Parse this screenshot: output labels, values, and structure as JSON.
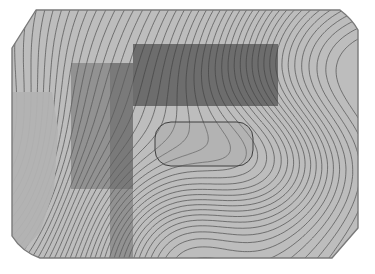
{
  "figure": {
    "title": "",
    "background_color": "#ffffff",
    "width": 375,
    "height": 274
  },
  "domain_outline": {
    "name": "simulation-domain-boundary",
    "stroke_color": "#7a7a7a",
    "description": "irregular polygon with chamfered top-left corner, rounded bottom-left corner, small rounded top-right corner and chamfered bottom-right corner",
    "vertices": [
      [
        36,
        10
      ],
      [
        340,
        10
      ],
      [
        352,
        19
      ],
      [
        358,
        30
      ],
      [
        358,
        228
      ],
      [
        332,
        258
      ],
      [
        40,
        258
      ],
      [
        22,
        252
      ],
      [
        12,
        236
      ],
      [
        12,
        48
      ]
    ]
  },
  "contour_field": {
    "name": "contour-line-field",
    "type": "contour",
    "line_color": "#4e4e4e",
    "line_width": 0.7,
    "fill_light": "#bdbdbd",
    "fill_mid": "#aaaaaa",
    "fill_plateau": "#b5b5b5",
    "n_levels": 46,
    "description": "dense greyscale contour lines sweeping from upper-left to lower-right with a saddle near the centre-right and a flat plateau region along the left edge"
  },
  "overlays": [
    {
      "id": "region-a",
      "name": "overlay-rect-dark-top",
      "shape": "rectangle",
      "x": 133,
      "y": 44,
      "width": 145,
      "height": 62,
      "fill": "#3c3c3c",
      "opacity": 0.62,
      "label": ""
    },
    {
      "id": "region-b",
      "name": "overlay-rect-mid-left",
      "shape": "rectangle",
      "x": 71,
      "y": 63,
      "width": 62,
      "height": 126,
      "fill": "#5e5e5e",
      "opacity": 0.45,
      "label": ""
    },
    {
      "id": "region-c",
      "name": "overlay-band-vertical",
      "shape": "rectangle",
      "x": 110,
      "y": 63,
      "width": 23,
      "height": 195,
      "fill": "#5e5e5e",
      "opacity": 0.45,
      "label": ""
    },
    {
      "id": "region-d",
      "name": "overlay-rounded-rect-center",
      "shape": "rounded-rectangle",
      "x": 155,
      "y": 122,
      "width": 98,
      "height": 44,
      "corner_radius": 16,
      "fill": "#9a9a9a",
      "opacity": 0.3,
      "stroke": "#3f3f3f",
      "label": ""
    }
  ],
  "chart_data": {
    "type": "heatmap",
    "title": "",
    "xlabel": "",
    "ylabel": "",
    "xlim": [
      0,
      1
    ],
    "ylim": [
      0,
      1
    ],
    "grid": false,
    "legend": "none",
    "colormap": "greys",
    "annotations": [
      "overlay-rect-dark-top",
      "overlay-rect-mid-left",
      "overlay-band-vertical",
      "overlay-rounded-rect-center"
    ],
    "contour_levels": [
      0.02,
      0.04,
      0.06,
      0.08,
      0.1,
      0.12,
      0.14,
      0.16,
      0.18,
      0.2,
      0.22,
      0.24,
      0.26,
      0.28,
      0.3,
      0.32,
      0.34,
      0.36,
      0.38,
      0.4,
      0.42,
      0.44,
      0.46,
      0.48,
      0.5,
      0.52,
      0.54,
      0.56,
      0.58,
      0.6,
      0.62,
      0.64,
      0.66,
      0.68,
      0.7,
      0.72,
      0.74,
      0.76,
      0.78,
      0.8,
      0.82,
      0.84,
      0.86,
      0.88,
      0.9,
      0.92
    ]
  }
}
